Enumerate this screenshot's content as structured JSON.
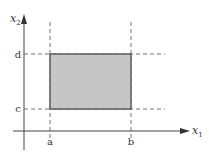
{
  "diagram": {
    "axes": {
      "x_label": "x",
      "x_sub": "1",
      "y_label": "x",
      "y_sub": "2"
    },
    "ticks": {
      "a": "a",
      "b": "b",
      "c": "c",
      "d": "d"
    },
    "colors": {
      "fill": "#c6c6c6",
      "border": "#555555",
      "axis": "#444444",
      "dashed": "#777777"
    }
  }
}
